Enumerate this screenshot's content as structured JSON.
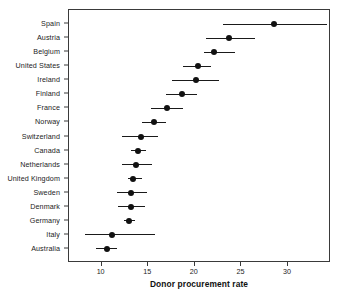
{
  "chart_data": {
    "type": "scatter",
    "title": "",
    "subtitle": "",
    "xlabel": "Donor procurement rate",
    "ylabel": "",
    "xlim": [
      6.5,
      34.6
    ],
    "ylim": [
      0,
      18
    ],
    "grid": false,
    "legend": null,
    "orientation": "horizontal",
    "marker": "filled-circle",
    "error_bars": "horizontal-confidence-interval",
    "xticks": [
      10,
      15,
      20,
      25,
      30
    ],
    "xticklabels": [
      "10",
      "15",
      "20",
      "25",
      "30"
    ],
    "categories": [
      "Spain",
      "Austria",
      "Belgium",
      "United States",
      "Ireland",
      "Finland",
      "France",
      "Norway",
      "Switzerland",
      "Canada",
      "Netherlands",
      "United Kingdom",
      "Sweden",
      "Denmark",
      "Germany",
      "Italy",
      "Australia"
    ],
    "values": [
      28.5,
      23.7,
      22.1,
      20.3,
      20.1,
      18.6,
      17.0,
      15.6,
      14.2,
      13.9,
      13.7,
      13.4,
      13.1,
      13.1,
      12.9,
      11.1,
      10.6
    ],
    "ci_low": [
      23.0,
      21.2,
      21.0,
      18.7,
      17.5,
      16.9,
      15.3,
      14.3,
      12.2,
      13.1,
      12.2,
      12.8,
      11.7,
      11.8,
      12.4,
      8.2,
      9.4
    ],
    "ci_high": [
      34.2,
      26.4,
      24.3,
      21.7,
      22.6,
      20.2,
      18.7,
      16.9,
      16.0,
      14.8,
      15.4,
      14.3,
      14.9,
      14.7,
      13.6,
      15.7,
      11.7
    ],
    "colors": {
      "marker": "#111111",
      "line": "#1a1a1a",
      "frame": "#3a3a3a",
      "background": "#ffffff",
      "text": "#1c1c1c"
    }
  }
}
